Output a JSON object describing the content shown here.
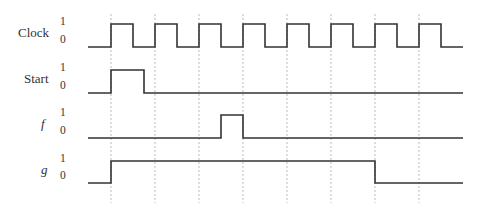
{
  "diagram": {
    "type": "timing-diagram",
    "colors": {
      "waveform": "#333333",
      "guide": "#bbbbbb",
      "background": "#ffffff"
    },
    "time": {
      "start_x": 88,
      "end_x": 463,
      "period": 44,
      "first_edge": 111,
      "num_edges": 8
    },
    "signals": [
      {
        "name": "Clock",
        "italic": false,
        "high_label": "1",
        "low_label": "0",
        "high_y": 24,
        "low_y": 47,
        "label_x": 18,
        "label_y": 24,
        "level_x": 60,
        "waveform": "clock",
        "transitions": []
      },
      {
        "name": "Start",
        "italic": false,
        "high_label": "1",
        "low_label": "0",
        "high_y": 70,
        "low_y": 93,
        "label_x": 24,
        "label_y": 70,
        "level_x": 60,
        "waveform": "pulses",
        "pulses": [
          [
            111,
            144
          ]
        ]
      },
      {
        "name": "f",
        "italic": true,
        "high_label": "1",
        "low_label": "0",
        "high_y": 115,
        "low_y": 138,
        "label_x": 41,
        "label_y": 115,
        "level_x": 60,
        "waveform": "pulses",
        "pulses": [
          [
            221,
            243
          ]
        ]
      },
      {
        "name": "g",
        "italic": true,
        "high_label": "1",
        "low_label": "0",
        "high_y": 161,
        "low_y": 183,
        "label_x": 41,
        "label_y": 161,
        "level_x": 60,
        "waveform": "pulses",
        "pulses": [
          [
            111,
            375
          ]
        ]
      }
    ],
    "guides": {
      "top_y": 14,
      "bottom_y": 203
    }
  }
}
